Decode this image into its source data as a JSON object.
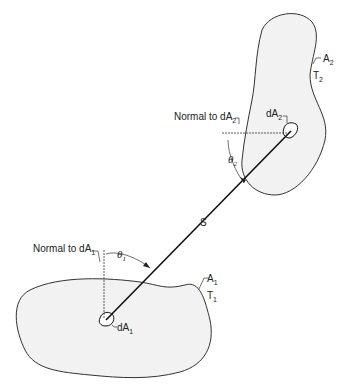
{
  "diagram": {
    "surface_1": {
      "area_label": "A",
      "area_sub": "1",
      "temp_label": "T",
      "temp_sub": "1",
      "element_label": "dA",
      "element_sub": "1",
      "normal_label": "Normal to dA",
      "normal_sub": "1",
      "angle_label": "θ",
      "angle_sub": "1",
      "fill": "#f2f2f2"
    },
    "surface_2": {
      "area_label": "A",
      "area_sub": "2",
      "temp_label": "T",
      "temp_sub": "2",
      "element_label": "dA",
      "element_sub": "2",
      "normal_label": "Normal to dA",
      "normal_sub": "2",
      "angle_label": "θ",
      "angle_sub": "2",
      "fill": "#f2f2f2"
    },
    "connecting_line": {
      "label": "S"
    }
  }
}
